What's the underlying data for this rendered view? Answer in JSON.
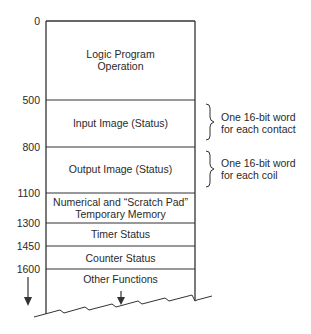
{
  "diagram": {
    "type": "memory-map",
    "address_labels": [
      "0",
      "500",
      "800",
      "1100",
      "1300",
      "1450",
      "1600"
    ],
    "segments": [
      {
        "start": "0",
        "label_line1": "Logic Program",
        "label_line2": "Operation"
      },
      {
        "start": "500",
        "label_line1": "Input Image (Status)",
        "label_line2": ""
      },
      {
        "start": "800",
        "label_line1": "Output Image (Status)",
        "label_line2": ""
      },
      {
        "start": "1100",
        "label_line1": "Numerical and “Scratch Pad”",
        "label_line2": "Temporary Memory"
      },
      {
        "start": "1300",
        "label_line1": "Timer Status",
        "label_line2": ""
      },
      {
        "start": "1450",
        "label_line1": "Counter Status",
        "label_line2": ""
      },
      {
        "start": "1600",
        "label_line1": "Other Functions",
        "label_line2": ""
      }
    ],
    "annotations": [
      {
        "segment": "Input Image (Status)",
        "line1": "One 16-bit word",
        "line2": "for each contact"
      },
      {
        "segment": "Output Image (Status)",
        "line1": "One 16-bit word",
        "line2": "for each coil"
      }
    ],
    "line_color": "#333333"
  }
}
